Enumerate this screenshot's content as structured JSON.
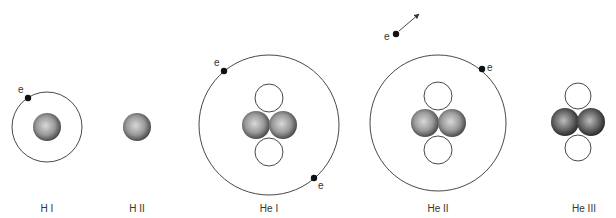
{
  "diagram": {
    "title": "",
    "electron_symbol": "e",
    "atoms": [
      {
        "id": "h1",
        "label": "H I",
        "cx": 47,
        "cy": 127,
        "orbit_r": 35,
        "protons": 1,
        "neutrons": 0,
        "electrons": 1,
        "state": "neutral hydrogen"
      },
      {
        "id": "h2",
        "label": "H II",
        "cx": 137,
        "cy": 127,
        "orbit_r": 0,
        "protons": 1,
        "neutrons": 0,
        "electrons": 0,
        "state": "ionized hydrogen"
      },
      {
        "id": "he1",
        "label": "He I",
        "cx": 269,
        "cy": 125,
        "orbit_r": 70,
        "protons": 2,
        "neutrons": 2,
        "electrons": 2,
        "state": "neutral helium"
      },
      {
        "id": "he2",
        "label": "He II",
        "cx": 438,
        "cy": 123,
        "orbit_r": 68,
        "protons": 2,
        "neutrons": 2,
        "electrons": 1,
        "free_electrons": 1,
        "state": "singly ionized helium"
      },
      {
        "id": "he3",
        "label": "He III",
        "cx": 578,
        "cy": 122,
        "orbit_r": 0,
        "protons": 2,
        "neutrons": 2,
        "electrons": 0,
        "state": "doubly ionized helium"
      }
    ],
    "colors": {
      "proton_light": "#d8d8d8",
      "proton_dark": "#3a3a3a",
      "line": "#333333",
      "electron": "#111111"
    }
  }
}
